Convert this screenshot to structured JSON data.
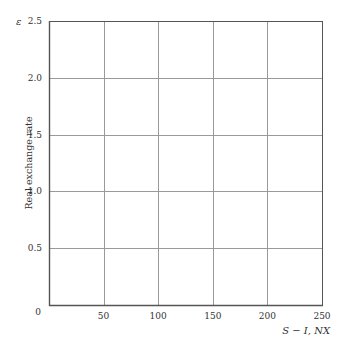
{
  "chart_data": {
    "type": "line",
    "title": "",
    "xlabel": "S − I, NX",
    "ylabel": "Real exchange rate",
    "ysymbol": "ε",
    "xlim": [
      0,
      250
    ],
    "ylim": [
      0,
      2.5
    ],
    "x_ticks": [
      50,
      100,
      150,
      200,
      250
    ],
    "x_tick_labels": [
      "50",
      "100",
      "150",
      "200",
      "250"
    ],
    "y_ticks": [
      0,
      0.5,
      1.0,
      1.5,
      2.0,
      2.5
    ],
    "y_tick_labels": [
      "0",
      "0.5",
      "1.0",
      "1.5",
      "2.0",
      "2.5"
    ],
    "grid": true,
    "series": [],
    "legend": null
  },
  "colors": {
    "axis": "#555555",
    "grid": "#9a9a9a",
    "text": "#333333"
  }
}
